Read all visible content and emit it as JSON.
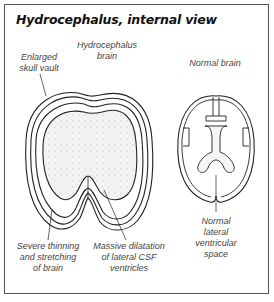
{
  "title": "Hydrocephalus, internal view",
  "labels": {
    "hydrocephalus_brain": "Hydrocephalus\nbrain",
    "enlarged_skull_vault": "Enlarged\nskull vault",
    "normal_brain": "Normal brain",
    "severe_thinning": "Severe thinning\nand stretching\nof brain",
    "massive_dilatation": "Massive dilatation\nof lateral CSF\nventricles",
    "normal_lateral": "Normal\nlateral\nventricular\nspace"
  }
}
